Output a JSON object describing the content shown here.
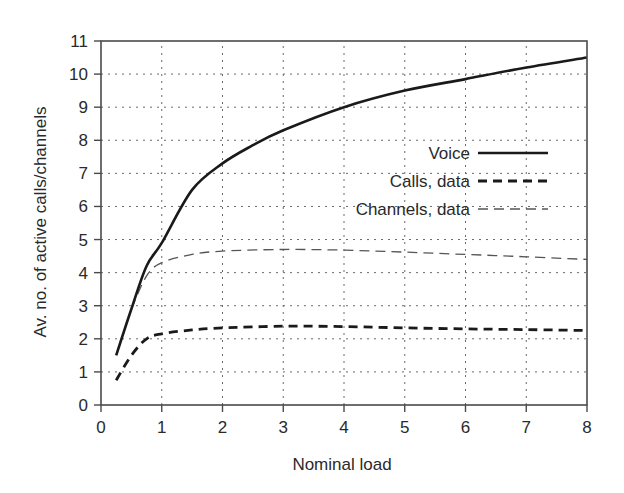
{
  "chart_data": {
    "type": "line",
    "title": "",
    "xlabel": "Nominal load",
    "ylabel": "Av. no. of active calls/channels",
    "xlim": [
      0,
      8
    ],
    "ylim": [
      0,
      11
    ],
    "xticks": [
      0,
      1,
      2,
      3,
      4,
      5,
      6,
      7,
      8
    ],
    "yticks": [
      0,
      1,
      2,
      3,
      4,
      5,
      6,
      7,
      8,
      9,
      10,
      11
    ],
    "grid": true,
    "grid_style": "dotted",
    "legend_position": "inside-right",
    "series": [
      {
        "name": "Voice",
        "line_style": "solid",
        "line_weight": "heavy",
        "x": [
          0.25,
          0.5,
          0.75,
          1.0,
          1.5,
          2.0,
          2.5,
          3.0,
          4.0,
          5.0,
          6.0,
          7.0,
          8.0
        ],
        "y": [
          1.5,
          2.9,
          4.2,
          4.9,
          6.5,
          7.3,
          7.85,
          8.3,
          9.0,
          9.5,
          9.85,
          10.2,
          10.5
        ]
      },
      {
        "name": "Calls, data",
        "line_style": "dashed",
        "line_weight": "heavy",
        "x": [
          0.25,
          0.5,
          0.75,
          1.0,
          1.5,
          2.0,
          3.0,
          4.0,
          5.0,
          6.0,
          7.0,
          8.0
        ],
        "y": [
          0.75,
          1.5,
          2.0,
          2.15,
          2.27,
          2.33,
          2.38,
          2.37,
          2.33,
          2.3,
          2.28,
          2.25
        ]
      },
      {
        "name": "Channels, data",
        "line_style": "dashed",
        "line_weight": "light",
        "x": [
          0.5,
          0.75,
          1.0,
          1.5,
          2.0,
          3.0,
          4.0,
          5.0,
          6.0,
          7.0,
          8.0
        ],
        "y": [
          2.9,
          3.9,
          4.3,
          4.55,
          4.65,
          4.7,
          4.68,
          4.62,
          4.55,
          4.48,
          4.4
        ]
      }
    ]
  },
  "colors": {
    "axis": "#4a4a4a",
    "grid": "#6a6a6a",
    "text": "#2a2a2a",
    "series_voice": "#1a1a1a",
    "series_calls": "#1a1a1a",
    "series_channels": "#555555"
  },
  "legend": {
    "items": [
      {
        "label": "Voice"
      },
      {
        "label": "Calls, data"
      },
      {
        "label": "Channels, data"
      }
    ]
  }
}
